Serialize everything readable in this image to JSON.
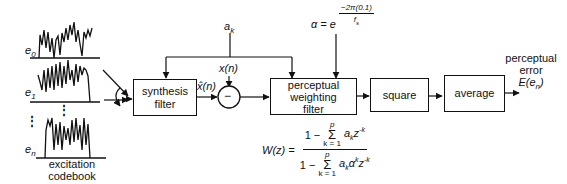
{
  "diagram": {
    "type": "block-diagram",
    "codebook": {
      "label_line1": "excitation",
      "label_line2": "codebook",
      "entries": [
        {
          "symbol": "e",
          "subscript": "0"
        },
        {
          "symbol": "e",
          "subscript": "1"
        },
        {
          "symbol": "e",
          "subscript": "n"
        }
      ],
      "ellipsis": "⋮"
    },
    "inputs": {
      "ak": {
        "symbol": "a",
        "subscript": "k"
      },
      "xn": "x(n)",
      "xhat": "x̂(n)",
      "alpha": {
        "lhs": "α = e",
        "exp_num": "−2π(0.1)",
        "exp_den": "f",
        "exp_den_sub": "s"
      }
    },
    "blocks": [
      {
        "id": "synthesis",
        "line1": "synthesis",
        "line2": "filter"
      },
      {
        "id": "subtract",
        "symbol": "−"
      },
      {
        "id": "weighting",
        "line1": "perceptual",
        "line2": "weighting",
        "line3": "filter"
      },
      {
        "id": "square",
        "line1": "square"
      },
      {
        "id": "average",
        "line1": "average"
      }
    ],
    "output": {
      "line1": "perceptual",
      "line2": "error",
      "line3": "E(e",
      "line3_sub": "n",
      "line3_close": ")"
    },
    "formula": {
      "lhs": "W(z) =",
      "num_one": "1 −",
      "sum_top": "p",
      "sum_sym": "Σ",
      "sum_bot": "k = 1",
      "num_term": "a",
      "num_term_sub": "k",
      "num_z": "z",
      "num_z_sup": "-k",
      "den_one": "1 −",
      "den_term": "a",
      "den_term_sub": "k",
      "den_alpha": "α",
      "den_alpha_sup": "k",
      "den_z": "z",
      "den_z_sup": "-k"
    },
    "colors": {
      "line": "#111111",
      "background": "#ffffff"
    }
  }
}
